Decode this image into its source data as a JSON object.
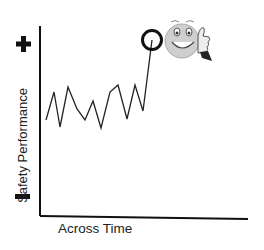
{
  "diagram": {
    "y_axis_label": "Safety Performance",
    "x_axis_label": "Across Time",
    "y_top_marker": "plus-icon",
    "y_bottom_marker": "minus-icon",
    "highlight_marker": "circle",
    "mascot": "smiley-thumbs-up",
    "line_values": [
      0.4,
      0.68,
      0.33,
      0.73,
      0.51,
      0.4,
      0.59,
      0.32,
      0.68,
      0.75,
      0.41,
      0.75,
      0.49,
      1.2
    ],
    "colors": {
      "line": "#222222",
      "axis": "#111111",
      "face": "#c8c8c8"
    }
  }
}
